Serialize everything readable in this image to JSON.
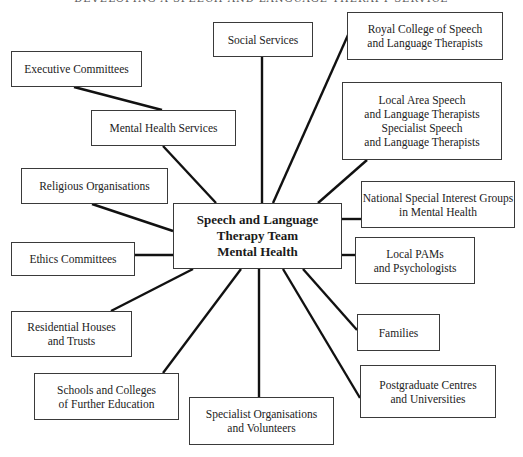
{
  "page": {
    "running_head": "DEVELOPING A SPEECH AND LANGUAGE THERAPY SERVICE"
  },
  "diagram": {
    "type": "hub-and-spoke",
    "center": {
      "label": "Speech and Language\nTherapy Team\nMental Health",
      "box": [
        173,
        203,
        169,
        66
      ]
    },
    "nodes": [
      {
        "id": "social-services",
        "label": "Social Services",
        "box": [
          213,
          22,
          100,
          35
        ]
      },
      {
        "id": "royal-college",
        "label": "Royal College of Speech\nand Language Therapists",
        "box": [
          347,
          12,
          156,
          48
        ]
      },
      {
        "id": "executive-committees",
        "label": "Executive Committees",
        "box": [
          11,
          51,
          131,
          36
        ]
      },
      {
        "id": "mental-health-services",
        "label": "Mental Health Services",
        "box": [
          91,
          110,
          145,
          36
        ]
      },
      {
        "id": "local-area-slt",
        "label": "Local Area Speech\nand Language Therapists\nSpecialist Speech\nand Language Therapists",
        "box": [
          342,
          82,
          160,
          78
        ]
      },
      {
        "id": "religious-organisations",
        "label": "Religious Organisations",
        "box": [
          21,
          168,
          147,
          36
        ]
      },
      {
        "id": "national-sig",
        "label": "National Special Interest Groups\nin Mental Health",
        "box": [
          361,
          181,
          154,
          47
        ]
      },
      {
        "id": "ethics-committees",
        "label": "Ethics Committees",
        "box": [
          11,
          242,
          124,
          34
        ]
      },
      {
        "id": "local-pams",
        "label": "Local PAMs\nand Psychologists",
        "box": [
          355,
          237,
          120,
          47
        ]
      },
      {
        "id": "residential-houses",
        "label": "Residential Houses\nand Trusts",
        "box": [
          11,
          311,
          121,
          46
        ]
      },
      {
        "id": "families",
        "label": "Families",
        "box": [
          357,
          314,
          83,
          37
        ]
      },
      {
        "id": "schools-colleges",
        "label": "Schools and Colleges\nof Further Education",
        "box": [
          34,
          373,
          145,
          47
        ]
      },
      {
        "id": "postgraduate-centres",
        "label": "Postgraduate Centres\nand Universities",
        "box": [
          360,
          365,
          136,
          53
        ]
      },
      {
        "id": "specialist-organisations",
        "label": "Specialist Organisations\nand Volunteers",
        "box": [
          189,
          397,
          145,
          48
        ]
      }
    ],
    "edges": [
      {
        "from": "executive-committees",
        "to": "mental-health-services",
        "line": [
          74,
          87,
          162,
          110
        ]
      },
      {
        "from": "mental-health-services",
        "to": "center",
        "line": [
          163,
          146,
          216,
          203
        ]
      },
      {
        "from": "social-services",
        "to": "center",
        "line": [
          262,
          57,
          262,
          203
        ]
      },
      {
        "from": "royal-college",
        "to": "center",
        "line": [
          348,
          35,
          273,
          203
        ]
      },
      {
        "from": "local-area-slt",
        "to": "center",
        "line": [
          367,
          160,
          318,
          203
        ]
      },
      {
        "from": "religious-organisations",
        "to": "center",
        "line": [
          92,
          204,
          173,
          231
        ]
      },
      {
        "from": "national-sig",
        "to": "center",
        "line": [
          361,
          219,
          342,
          219
        ]
      },
      {
        "from": "ethics-committees",
        "to": "center",
        "line": [
          135,
          255,
          173,
          255
        ]
      },
      {
        "from": "local-pams",
        "to": "center",
        "line": [
          355,
          255,
          342,
          255
        ]
      },
      {
        "from": "residential-houses",
        "to": "center",
        "line": [
          111,
          311,
          193,
          269
        ]
      },
      {
        "from": "families",
        "to": "center",
        "line": [
          357,
          330,
          303,
          269
        ]
      },
      {
        "from": "schools-colleges",
        "to": "center",
        "line": [
          163,
          373,
          241,
          269
        ]
      },
      {
        "from": "postgraduate-centres",
        "to": "center",
        "line": [
          360,
          398,
          283,
          269
        ]
      },
      {
        "from": "specialist-organisations",
        "to": "center",
        "line": [
          259,
          397,
          259,
          269
        ]
      }
    ]
  }
}
